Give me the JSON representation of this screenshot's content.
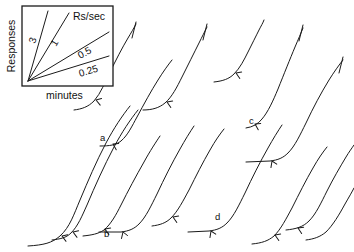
{
  "figure": {
    "type": "cumulative-record",
    "background_color": "#ffffff",
    "ink_color": "#1a1a1a",
    "width": 354,
    "height": 252
  },
  "inset": {
    "name": "rate-reference-inset",
    "unit_label": "Rs/sec",
    "y_axis_label": "Responses",
    "x_axis_label": "minutes",
    "frame": {
      "x": 22,
      "y": 6,
      "width": 91,
      "height": 80
    },
    "origin": {
      "x": 28,
      "y": 81
    },
    "slopes": [
      {
        "label": "3",
        "value": 3,
        "end_x": 48,
        "end_y": 11,
        "label_x": 35,
        "label_y": 44,
        "label_rot": -72
      },
      {
        "label": "1",
        "value": 1,
        "end_x": 69,
        "end_y": 13,
        "label_x": 56,
        "label_y": 47,
        "label_rot": -60
      },
      {
        "label": "0.5",
        "value": 0.5,
        "end_x": 109,
        "end_y": 32,
        "label_x": 80,
        "label_y": 59,
        "label_rot": -28
      },
      {
        "label": "0.25",
        "value": 0.25,
        "end_x": 109,
        "end_y": 56,
        "label_x": 80,
        "label_y": 77,
        "label_rot": -17
      }
    ]
  },
  "chart_data": {
    "type": "line",
    "title": "",
    "xlabel": "minutes",
    "ylabel": "Responses",
    "legend_title": "Rs/sec",
    "legend_entries": [
      "3",
      "1",
      "0.5",
      "0.25"
    ],
    "grid": false,
    "records": [
      {
        "name": "record-1",
        "path": "M 28,246 C 44,245 52,243 60,236 C 70,227 74,214 80,200 C 88,181 96,162 106,143 C 114,128 122,116 130,106",
        "pips": [
          {
            "x": 62,
            "y": 236,
            "angle": -50
          }
        ],
        "reset_tick": null
      },
      {
        "name": "record-2",
        "path": "M 52,240 C 60,239 66,238 71,233 C 78,226 82,216 87,205 C 95,186 104,166 114,147 C 122,132 130,120 138,110",
        "pips": [
          {
            "x": 73,
            "y": 232,
            "angle": -50
          }
        ],
        "reset_tick": null
      },
      {
        "name": "record-3-upper",
        "path": "M 74,110 C 82,109 88,107 94,101 C 101,93 105,82 110,72 C 116,60 122,48 128,38 C 131,33 134,28 136,24",
        "pips": [
          {
            "x": 96,
            "y": 100,
            "angle": -52
          }
        ],
        "reset_tick": {
          "x1": 136,
          "y1": 22,
          "x2": 132,
          "y2": 38
        }
      },
      {
        "name": "record-4",
        "path": "M 100,146 C 110,146 116,145 121,141 C 128,135 132,126 137,117 C 144,104 151,91 158,80 C 163,72 168,65 172,60",
        "pips": [
          {
            "x": 113,
            "y": 144,
            "angle": -42
          }
        ],
        "reset_tick": null
      },
      {
        "name": "record-5",
        "path": "M 83,236 C 92,235 98,234 104,230 C 111,224 116,215 121,205 C 128,191 136,176 144,162 C 150,151 156,142 160,136",
        "pips": [
          {
            "x": 105,
            "y": 229,
            "angle": -48
          }
        ],
        "reset_tick": null
      },
      {
        "name": "record-6",
        "path": "M 99,232 L 121,232 C 129,231 134,229 139,224 C 146,217 151,206 157,194 C 164,179 172,163 180,149 C 185,140 190,132 194,126",
        "pips": [
          {
            "x": 123,
            "y": 232,
            "angle": 0
          }
        ],
        "reset_tick": null
      },
      {
        "name": "record-7-upper",
        "path": "M 143,110 C 152,110 159,108 165,103 C 172,97 177,87 182,77 C 188,65 194,53 199,43 C 202,37 205,31 207,27",
        "pips": [
          {
            "x": 167,
            "y": 102,
            "angle": -48
          }
        ],
        "reset_tick": {
          "x1": 207,
          "y1": 24,
          "x2": 203,
          "y2": 40
        }
      },
      {
        "name": "record-8",
        "path": "M 152,226 C 160,225 166,223 171,218 C 178,211 183,201 189,190 C 196,176 203,162 210,150 C 215,141 220,134 224,129",
        "pips": [
          {
            "x": 173,
            "y": 217,
            "angle": -48
          }
        ],
        "reset_tick": null
      },
      {
        "name": "record-9",
        "path": "M 188,232 L 209,231 C 217,230 222,228 227,223 C 234,216 239,205 245,193 C 252,178 260,162 268,148 C 273,139 278,131 282,125",
        "pips": [
          {
            "x": 211,
            "y": 231,
            "angle": -4
          }
        ],
        "reset_tick": null
      },
      {
        "name": "record-10-upper",
        "path": "M 214,82 C 223,81 229,79 234,74 C 240,68 244,60 248,52 C 252,44 256,36 259,30 C 261,26 263,23 264,20",
        "pips": [
          {
            "x": 236,
            "y": 73,
            "angle": -48
          }
        ],
        "reset_tick": null
      },
      {
        "name": "record-11-upper",
        "path": "M 246,128 C 253,127 258,124 262,119 C 268,112 273,101 278,89 C 284,74 290,59 295,47 C 298,40 301,33 303,28",
        "pips": [
          {
            "x": 255,
            "y": 124,
            "angle": -42
          }
        ],
        "reset_tick": {
          "x1": 303,
          "y1": 25,
          "x2": 299,
          "y2": 41
        }
      },
      {
        "name": "record-12",
        "path": "M 246,162 L 270,161 C 278,160 283,158 288,153 C 295,146 300,135 306,123 C 313,108 321,93 329,80 C 334,72 339,65 343,60",
        "pips": [
          {
            "x": 272,
            "y": 161,
            "angle": -4
          }
        ],
        "reset_tick": {
          "x1": 343,
          "y1": 57,
          "x2": 339,
          "y2": 73
        }
      },
      {
        "name": "record-13",
        "path": "M 252,244 C 262,243 268,241 274,236 C 281,229 286,219 292,208 C 299,194 306,180 313,168 C 318,159 323,152 327,147",
        "pips": [
          {
            "x": 275,
            "y": 235,
            "angle": -48
          }
        ],
        "reset_tick": null
      },
      {
        "name": "record-14",
        "path": "M 286,230 C 296,229 303,227 309,221 C 316,214 321,203 327,191 C 333,179 340,167 346,157 C 349,152 352,148 354,145",
        "pips": [
          {
            "x": 298,
            "y": 228,
            "angle": -46
          }
        ],
        "reset_tick": null
      },
      {
        "name": "record-15-tail",
        "path": "M 306,240 C 314,239 320,237 326,232 C 333,225 339,215 345,204 C 349,197 352,192 354,188",
        "pips": [],
        "reset_tick": null
      }
    ],
    "point_labels": [
      {
        "id": "a",
        "label": "a",
        "x": 100,
        "y": 141
      },
      {
        "id": "b",
        "label": "b",
        "x": 104,
        "y": 237
      },
      {
        "id": "c",
        "label": "c",
        "x": 249,
        "y": 124
      },
      {
        "id": "d",
        "label": "d",
        "x": 215,
        "y": 220
      }
    ]
  }
}
